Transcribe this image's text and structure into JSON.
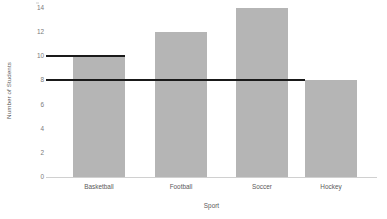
{
  "chart_data": {
    "type": "bar",
    "title": "",
    "xlabel": "Sport",
    "ylabel": "Number of Students",
    "categories": [
      "Basketball",
      "Football",
      "Soccer",
      "Hockey"
    ],
    "values": [
      10,
      12,
      14,
      8
    ],
    "series": [
      {
        "name": "Number of Students",
        "values": [
          10,
          12,
          14,
          8
        ]
      }
    ],
    "ylim": [
      0,
      14
    ],
    "yticks": [
      0,
      2,
      4,
      6,
      8,
      10,
      12,
      14
    ],
    "ytick_labels": [
      "0",
      "2",
      "4",
      "6",
      "8",
      "10",
      "12",
      "14"
    ],
    "grid": false,
    "legend": "none",
    "bar_color": "#b5b5b5",
    "axis_color": "#d0d0d0",
    "text_color": "#5a5a5a",
    "annotations": [
      {
        "name": "reference-line-10",
        "type": "horizontal-line",
        "y": 10,
        "color": "#1a1a1a",
        "x_start_category": "axis",
        "x_end_category": "Basketball",
        "note": "Solid black line at 10, from y-axis to right edge of Basketball bar"
      },
      {
        "name": "reference-line-8",
        "type": "horizontal-line",
        "y": 8,
        "color": "#1a1a1a",
        "x_start_category": "axis",
        "x_end_category": "Hockey",
        "note": "Solid black line at 8, from y-axis to left edge of Hockey bar"
      }
    ]
  },
  "layout": {
    "bars_px": [
      {
        "label": "Basketball",
        "left": 27,
        "width": 52,
        "value": 10
      },
      {
        "label": "Football",
        "left": 109,
        "width": 52,
        "value": 12
      },
      {
        "label": "Soccer",
        "left": 190,
        "width": 52,
        "value": 14
      },
      {
        "label": "Hockey",
        "left": 259,
        "width": 52,
        "value": 8
      }
    ],
    "ref_lines_px": [
      {
        "name": "reference-line-10",
        "left": 0,
        "width": 79,
        "value": 10
      },
      {
        "name": "reference-line-8",
        "left": 0,
        "width": 259,
        "value": 8
      }
    ]
  }
}
